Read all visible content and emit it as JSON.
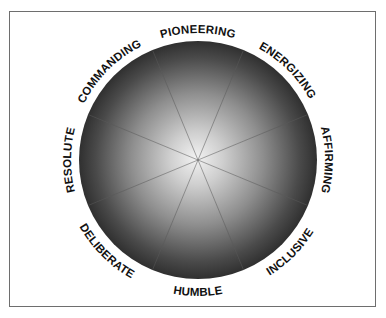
{
  "diagram": {
    "type": "leadership-style-wheel",
    "segments": [
      {
        "label": "PIONEERING",
        "angle_deg": 0
      },
      {
        "label": "ENERGIZING",
        "angle_deg": 45
      },
      {
        "label": "AFFIRMING",
        "angle_deg": 90
      },
      {
        "label": "INCLUSIVE",
        "angle_deg": 135
      },
      {
        "label": "HUMBLE",
        "angle_deg": 180
      },
      {
        "label": "DELIBERATE",
        "angle_deg": 225
      },
      {
        "label": "RESOLUTE",
        "angle_deg": 270
      },
      {
        "label": "COMMANDING",
        "angle_deg": 315
      }
    ],
    "spoke_count": 8,
    "colors": {
      "center": "#ececec",
      "edge": "#2e2e2e",
      "frame": "#6e6e6e",
      "text": "#111111"
    }
  }
}
